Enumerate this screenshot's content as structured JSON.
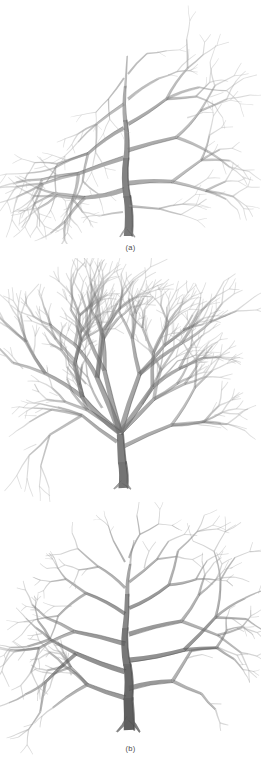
{
  "document": {
    "type": "figure-plate",
    "background_color": "#ffffff",
    "ink_color": "#6b6b6b",
    "width": 261,
    "height": 757,
    "subject": "bare-deciduous-tree-branching-forms",
    "medium": "graphite-pencil-drawing"
  },
  "panels": [
    {
      "id": "a",
      "caption": "(a)",
      "name": "tree-excurrent-form",
      "description": "single dominant central leader trunk with tiered horizontal lateral branches",
      "trunk_color": "#777777",
      "branch_color": "#8a8a8a",
      "twig_color": "#adadad",
      "bounds": {
        "x": 6,
        "y": 14,
        "width": 250,
        "height": 224
      }
    },
    {
      "id": "b",
      "caption": "(b)",
      "name": "tree-vase-form",
      "description": "low forking trunk splitting into multiple ascending arching leaders with dense twiggy crown",
      "trunk_color": "#747474",
      "branch_color": "#868686",
      "twig_color": "#a9a9a9",
      "bounds": {
        "x": 8,
        "y": 268,
        "width": 246,
        "height": 216
      }
    },
    {
      "id": "c",
      "caption": "(c)",
      "name": "tree-decurrent-form",
      "description": "thick dark central trunk with wide horizontally spreading scaffold branches",
      "trunk_color": "#5f5f5f",
      "branch_color": "#7b7b7b",
      "twig_color": "#a4a4a4",
      "bounds": {
        "x": 10,
        "y": 508,
        "width": 244,
        "height": 215
      }
    }
  ]
}
